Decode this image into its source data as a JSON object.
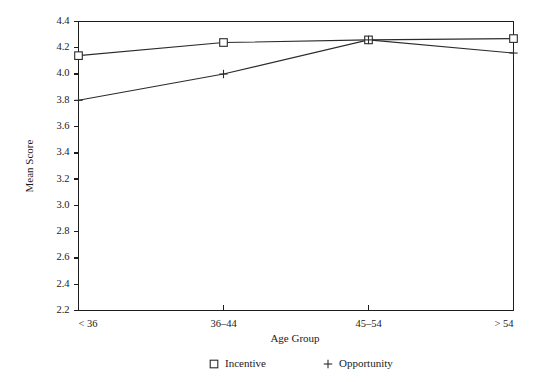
{
  "chart_data": {
    "type": "line",
    "title": "",
    "xlabel": "Age Group",
    "ylabel": "Mean Score",
    "categories": [
      "< 36",
      "36–44",
      "45–54",
      "> 54"
    ],
    "series": [
      {
        "name": "Incentive",
        "marker": "square",
        "values": [
          4.14,
          4.24,
          4.26,
          4.27
        ]
      },
      {
        "name": "Opportunity",
        "marker": "plus",
        "values": [
          3.8,
          4.0,
          4.26,
          4.16
        ]
      }
    ],
    "ylim": [
      2.2,
      4.4
    ],
    "yticks": [
      2.2,
      2.4,
      2.6,
      2.8,
      3.0,
      3.2,
      3.4,
      3.6,
      3.8,
      4.0,
      4.2,
      4.4
    ],
    "ytick_labels": [
      "2.2",
      "2.4",
      "2.6",
      "2.8",
      "3.0",
      "3.2",
      "3.4",
      "3.6",
      "3.8",
      "4.0",
      "4.2",
      "4.4"
    ],
    "grid": false,
    "legend_position": "bottom",
    "legend": [
      {
        "label": "Incentive",
        "marker": "square"
      },
      {
        "label": "Opportunity",
        "marker": "plus"
      }
    ],
    "line_color": "#2b2b2b",
    "axis_color": "#1c1c1c",
    "background": "#ffffff"
  }
}
